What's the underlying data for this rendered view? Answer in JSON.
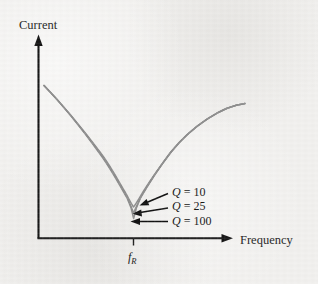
{
  "figure": {
    "background_color": "#f1f0ee",
    "axis_color": "#111111",
    "curve_color": "#8b8b8b",
    "pointer_color": "#0d0d0d"
  },
  "axes": {
    "y_label": "Current",
    "x_label": "Frequency",
    "x_tick_label_main": "f",
    "x_tick_label_sub": "R"
  },
  "legend": {
    "items": [
      {
        "prefix": "Q",
        "equals": " = ",
        "value": "10"
      },
      {
        "prefix": "Q",
        "equals": " = ",
        "value": "25"
      },
      {
        "prefix": "Q",
        "equals": " = ",
        "value": "100"
      }
    ],
    "label_q10": "Q = 10",
    "label_q25": "Q = 25",
    "label_q100": "Q = 100"
  },
  "chart_data": {
    "type": "line",
    "title": "",
    "subtitle": "",
    "xlabel": "Frequency",
    "ylabel": "Current",
    "grid": false,
    "legend_position": "inline-annotations-right",
    "annotations": [
      {
        "text": "Q = 10",
        "points_to_series": "Q = 10",
        "at_x": "f_R",
        "arrow": true
      },
      {
        "text": "Q = 25",
        "points_to_series": "Q = 25",
        "at_x": "f_R",
        "arrow": true
      },
      {
        "text": "Q = 100",
        "points_to_series": "Q = 100",
        "at_x": "f_R",
        "arrow": true
      }
    ],
    "xticks": [
      "f_R"
    ],
    "xtick_positions": [
      1.0
    ],
    "yticks": [],
    "xlim": [
      0.0,
      2.2
    ],
    "ylim": [
      0.0,
      1.0
    ],
    "resonant_frequency_x": 1.0,
    "series": [
      {
        "name": "Q = 10",
        "q_factor": 10,
        "minimum": {
          "x": 1.0,
          "y": 0.175
        },
        "x": [
          0.38,
          0.5,
          0.62,
          0.72,
          0.8,
          0.86,
          0.91,
          0.95,
          0.98,
          1.0,
          1.03,
          1.07,
          1.12,
          1.18,
          1.26,
          1.36,
          1.5,
          1.68,
          1.9,
          2.08
        ],
        "y": [
          0.855,
          0.735,
          0.61,
          0.5,
          0.41,
          0.34,
          0.275,
          0.225,
          0.195,
          0.175,
          0.19,
          0.225,
          0.285,
          0.355,
          0.44,
          0.53,
          0.64,
          0.74,
          0.82,
          0.862
        ]
      },
      {
        "name": "Q = 25",
        "q_factor": 25,
        "minimum": {
          "x": 1.0,
          "y": 0.105
        },
        "x": [
          0.38,
          0.5,
          0.62,
          0.72,
          0.8,
          0.86,
          0.91,
          0.95,
          0.98,
          1.0,
          1.03,
          1.07,
          1.12,
          1.18,
          1.26,
          1.36,
          1.5,
          1.68,
          1.9,
          2.08
        ],
        "y": [
          0.855,
          0.735,
          0.605,
          0.492,
          0.398,
          0.32,
          0.245,
          0.175,
          0.128,
          0.105,
          0.13,
          0.18,
          0.252,
          0.33,
          0.42,
          0.518,
          0.632,
          0.736,
          0.818,
          0.862
        ]
      },
      {
        "name": "Q = 100",
        "q_factor": 100,
        "minimum": {
          "x": 1.0,
          "y": 0.048
        },
        "x": [
          0.38,
          0.5,
          0.62,
          0.72,
          0.8,
          0.86,
          0.91,
          0.95,
          0.98,
          1.0,
          1.03,
          1.07,
          1.12,
          1.18,
          1.26,
          1.36,
          1.5,
          1.68,
          1.9,
          2.08
        ],
        "y": [
          0.855,
          0.733,
          0.602,
          0.487,
          0.39,
          0.305,
          0.225,
          0.145,
          0.082,
          0.048,
          0.085,
          0.148,
          0.23,
          0.312,
          0.405,
          0.506,
          0.624,
          0.732,
          0.816,
          0.862
        ]
      }
    ]
  }
}
